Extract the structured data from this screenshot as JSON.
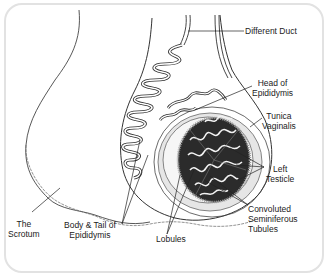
{
  "diagram": {
    "labels": {
      "duct": "Different Duct",
      "head_epididymis_1": "Head of",
      "head_epididymis_2": "Epididymis",
      "tunica_1": "Tunica",
      "tunica_2": "Vaginalis",
      "testicle_1": "Left",
      "testicle_2": "Testicle",
      "convoluted_1": "Convoluted",
      "convoluted_2": "Seminiferous",
      "convoluted_3": "Tubules",
      "lobules": "Lobules",
      "body_tail_1": "Body & Tail of",
      "body_tail_2": "Epididymis",
      "scrotum_1": "The",
      "scrotum_2": "Scrotum"
    },
    "colors": {
      "line": "#333333",
      "testis_fill": "#2b2b2b",
      "tubule": "#f2f2f2",
      "frame": "#e2e2e2",
      "shade": "#cfcfcf"
    }
  }
}
